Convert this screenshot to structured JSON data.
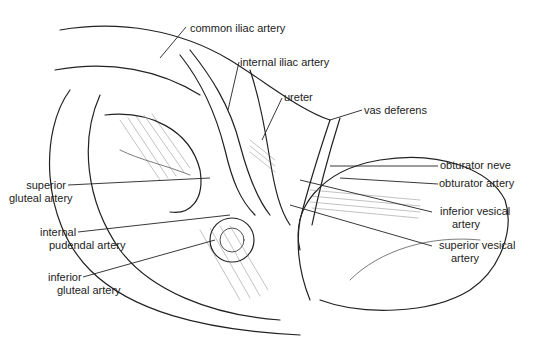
{
  "diagram": {
    "labels": [
      {
        "id": "common_iliac",
        "lines": [
          "common iliac artery"
        ]
      },
      {
        "id": "internal_iliac",
        "lines": [
          "internal iliac artery"
        ]
      },
      {
        "id": "ureter",
        "lines": [
          "ureter"
        ]
      },
      {
        "id": "vas_deferens",
        "lines": [
          "vas deferens"
        ]
      },
      {
        "id": "obturator_nerve",
        "lines": [
          "obturator neve"
        ]
      },
      {
        "id": "obturator_artery",
        "lines": [
          "obturator artery"
        ]
      },
      {
        "id": "superior_gluteal",
        "lines": [
          "superior",
          "gluteal artery"
        ]
      },
      {
        "id": "inferior_vesical",
        "lines": [
          "inferior vesical",
          "artery"
        ]
      },
      {
        "id": "internal_pudendal",
        "lines": [
          "internal",
          "pudendal artery"
        ]
      },
      {
        "id": "superior_vesical",
        "lines": [
          "superior vesical",
          "artery"
        ]
      },
      {
        "id": "inferior_gluteal",
        "lines": [
          "inferior",
          "gluteal artery"
        ]
      }
    ],
    "colors": {
      "ink": "#222222",
      "background": "#ffffff",
      "hatch": "#666666"
    }
  }
}
